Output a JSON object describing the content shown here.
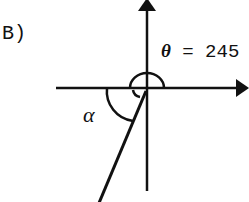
{
  "diagram": {
    "part_label": "B)",
    "theta": {
      "symbol": "θ",
      "equals": " = ",
      "value": "245"
    },
    "alpha": {
      "symbol": "α"
    },
    "colors": {
      "ink": "#111111",
      "background": "#ffffff"
    }
  }
}
